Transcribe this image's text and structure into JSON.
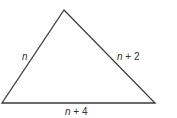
{
  "diagram": {
    "type": "triangle",
    "stroke_color": "#3a3a3a",
    "vertices": {
      "top": [
        64,
        10
      ],
      "bottom_left": [
        2,
        103
      ],
      "bottom_right": [
        155,
        103
      ]
    },
    "labels": {
      "left_side": {
        "var": "n",
        "rest": ""
      },
      "right_side": {
        "var": "n",
        "rest": " + 2"
      },
      "bottom_side": {
        "var": "n",
        "rest": " + 4"
      }
    }
  }
}
